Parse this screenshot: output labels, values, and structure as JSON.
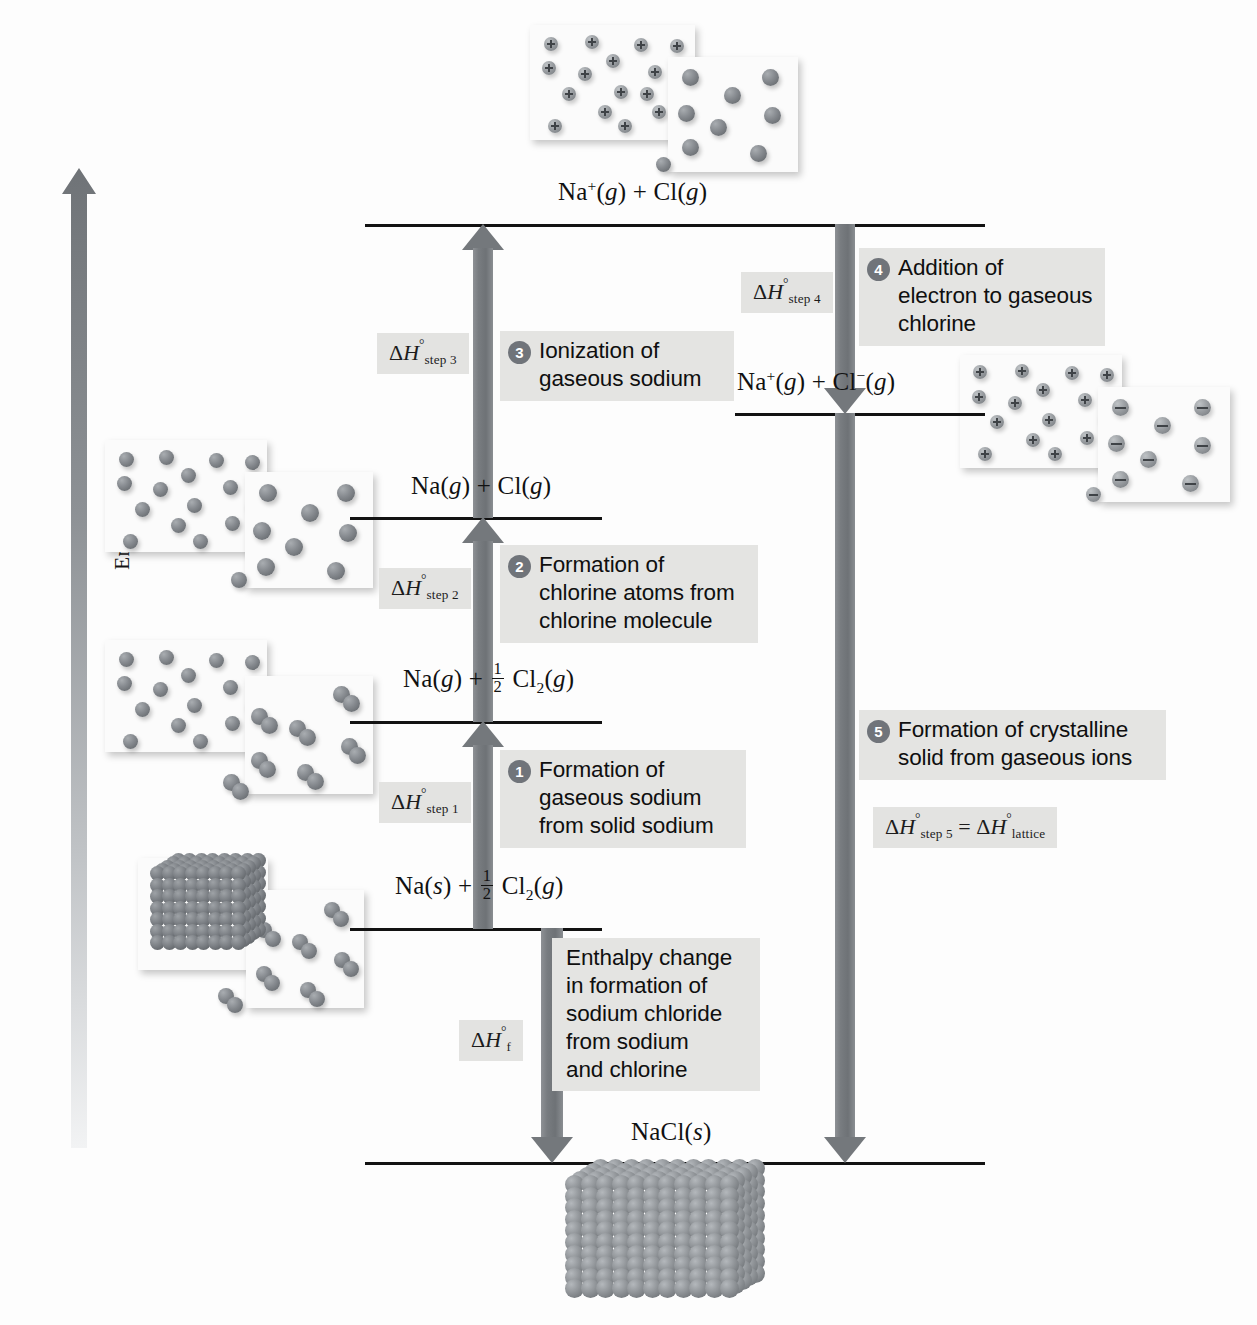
{
  "figure": {
    "type": "enthalpy-level-diagram",
    "axis": {
      "label_prefix": "Enthalpy, ",
      "label_symbol": "H",
      "direction": "increasing upward"
    }
  },
  "levels": [
    {
      "id": "level-na-plus-cl",
      "label_html": "Na<sup>+</sup>(<i>g</i>) + Cl(<i>g</i>)",
      "label_text": "Na+(g) + Cl(g)"
    },
    {
      "id": "level-na-plus-cl-minus",
      "label_html": "Na<sup>+</sup>(<i>g</i>) + Cl<sup>&minus;</sup>(<i>g</i>)",
      "label_text": "Na+(g) + Cl-(g)"
    },
    {
      "id": "level-na-g-cl-g",
      "label_html": "Na(<i>g</i>) + Cl(<i>g</i>)",
      "label_text": "Na(g) + Cl(g)"
    },
    {
      "id": "level-na-g-half-cl2",
      "label_html": "Na(<i>g</i>) + <span class=\"frac\"><span class=\"num\">1</span><span class=\"den\">2</span></span> Cl<sub>2</sub>(<i>g</i>)",
      "label_text": "Na(g) + 1/2 Cl2(g)"
    },
    {
      "id": "level-na-s-half-cl2",
      "label_html": "Na(<i>s</i>) + <span class=\"frac\"><span class=\"num\">1</span><span class=\"den\">2</span></span> Cl<sub>2</sub>(<i>g</i>)",
      "label_text": "Na(s) + 1/2 Cl2(g)"
    },
    {
      "id": "level-nacl-s",
      "label_html": "NaCl(<i>s</i>)",
      "label_text": "NaCl(s)"
    }
  ],
  "steps": [
    {
      "number": "1",
      "enthalpy_html": "&Delta;<span class=\"it\">H</span><span class=\"deg\">&deg;</span><sub>step 1</sub>",
      "enthalpy_text": "ΔH°step 1",
      "description": "Formation of\ngaseous sodium\nfrom solid sodium",
      "direction": "up"
    },
    {
      "number": "2",
      "enthalpy_html": "&Delta;<span class=\"it\">H</span><span class=\"deg\">&deg;</span><sub>step 2</sub>",
      "enthalpy_text": "ΔH°step 2",
      "description": "Formation of\nchlorine atoms from\nchlorine molecule",
      "direction": "up"
    },
    {
      "number": "3",
      "enthalpy_html": "&Delta;<span class=\"it\">H</span><span class=\"deg\">&deg;</span><sub>step 3</sub>",
      "enthalpy_text": "ΔH°step 3",
      "description": "Ionization of\ngaseous sodium",
      "direction": "up"
    },
    {
      "number": "4",
      "enthalpy_html": "&Delta;<span class=\"it\">H</span><span class=\"deg\">&deg;</span><sub>step 4</sub>",
      "enthalpy_text": "ΔH°step 4",
      "description": "Addition of\nelectron to gaseous\nchlorine",
      "direction": "down"
    },
    {
      "number": "5",
      "enthalpy_html": "&Delta;<span class=\"it\">H</span><span class=\"deg\">&deg;</span><sub>step 5</sub> = &Delta;<span class=\"it\">H</span><span class=\"deg\">&deg;</span><sub>lattice</sub>",
      "enthalpy_text": "ΔH°step 5 = ΔH°lattice",
      "description": "Formation of crystalline\nsolid from gaseous ions",
      "direction": "down"
    }
  ],
  "formation": {
    "enthalpy_html": "&Delta;<span class=\"it\">H</span><span class=\"deg\">&deg;</span><sub>f</sub>",
    "enthalpy_text": "ΔH°f",
    "description": "Enthalpy change\nin formation of\nsodium chloride\nfrom sodium\nand chlorine",
    "direction": "down"
  },
  "illustrations": [
    {
      "id": "img-na-plus-and-cl-atoms",
      "caption_for": "Na+(g) + Cl(g)",
      "left_species": "sodium ions (+)",
      "right_species": "chlorine atoms"
    },
    {
      "id": "img-na-plus-and-cl-minus",
      "caption_for": "Na+(g) + Cl-(g)",
      "left_species": "sodium ions (+)",
      "right_species": "chloride ions (-)"
    },
    {
      "id": "img-na-atoms-and-cl-atoms",
      "caption_for": "Na(g) + Cl(g)",
      "left_species": "sodium atoms",
      "right_species": "chlorine atoms"
    },
    {
      "id": "img-na-atoms-and-cl2",
      "caption_for": "Na(g) + 1/2 Cl2(g)",
      "left_species": "sodium atoms",
      "right_species": "chlorine molecules"
    },
    {
      "id": "img-na-solid-and-cl2",
      "caption_for": "Na(s) + 1/2 Cl2(g)",
      "left_species": "sodium metal crystal",
      "right_species": "chlorine molecules"
    },
    {
      "id": "img-nacl-crystal",
      "caption_for": "NaCl(s)",
      "left_species": "sodium chloride crystal",
      "right_species": ""
    }
  ],
  "colors": {
    "arrow": "#74787c",
    "badge": "#70747a",
    "tag_background": "#e3e3e1",
    "level_line": "#121212",
    "text": "#111111"
  }
}
